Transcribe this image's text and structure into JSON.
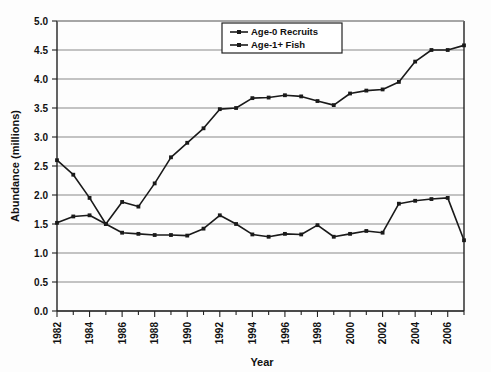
{
  "chart_data": {
    "type": "line",
    "title": "",
    "xlabel": "Year",
    "ylabel": "Abundance (millions)",
    "xlim": [
      1982,
      2007
    ],
    "ylim": [
      0.0,
      5.0
    ],
    "ytick_step": 0.5,
    "grid": true,
    "legend_position": "top-center",
    "x": [
      1982,
      1983,
      1984,
      1985,
      1986,
      1987,
      1988,
      1989,
      1990,
      1991,
      1992,
      1993,
      1994,
      1995,
      1996,
      1997,
      1998,
      1999,
      2000,
      2001,
      2002,
      2003,
      2004,
      2005,
      2006,
      2007
    ],
    "xtick_labels": [
      "1982",
      "1984",
      "1986",
      "1988",
      "1990",
      "1992",
      "1994",
      "1996",
      "1998",
      "2000",
      "2002",
      "2004",
      "2006"
    ],
    "ytick_labels": [
      "0.0",
      "0.5",
      "1.0",
      "1.5",
      "2.0",
      "2.5",
      "3.0",
      "3.5",
      "4.0",
      "4.5",
      "5.0"
    ],
    "series": [
      {
        "name": "Age-0 Recruits",
        "color": "#1a1a1a",
        "marker": "square",
        "values": [
          2.6,
          2.35,
          1.95,
          1.5,
          1.88,
          1.8,
          2.2,
          2.65,
          2.9,
          3.15,
          3.48,
          3.5,
          3.67,
          3.68,
          3.72,
          3.7,
          3.62,
          3.55,
          3.75,
          3.8,
          3.82,
          3.95,
          4.3,
          4.5,
          4.5,
          4.58
        ]
      },
      {
        "name": "Age-1+ Fish",
        "color": "#1a1a1a",
        "marker": "square",
        "values": [
          1.52,
          1.63,
          1.65,
          1.5,
          1.35,
          1.33,
          1.31,
          1.31,
          1.3,
          1.42,
          1.65,
          1.5,
          1.32,
          1.28,
          1.33,
          1.32,
          1.48,
          1.28,
          1.33,
          1.38,
          1.35,
          1.85,
          1.9,
          1.93,
          1.95,
          1.22
        ]
      }
    ]
  },
  "legend": {
    "entries": [
      {
        "label": "Age-0 Recruits"
      },
      {
        "label": "Age-1+ Fish"
      }
    ]
  },
  "axes": {
    "x_title": "Year",
    "y_title": "Abundance (millions)"
  }
}
